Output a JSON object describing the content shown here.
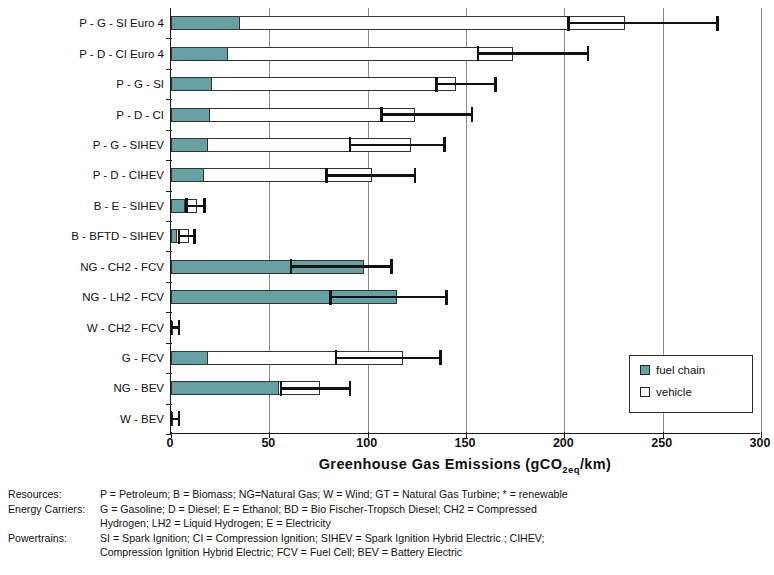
{
  "chart_data": {
    "type": "bar",
    "orientation": "horizontal",
    "stacked": true,
    "title": "",
    "xlabel": "Greenhouse Gas Emissions (gCO2eq/km)",
    "xlabel_main": "Greenhouse Gas Emissions (gCO",
    "xlabel_sub": "2eq",
    "xlabel_tail": "/km)",
    "ylabel": "",
    "xlim": [
      0,
      300
    ],
    "xticks": [
      0,
      50,
      100,
      150,
      200,
      250,
      300
    ],
    "xticklabels": [
      "0",
      "50",
      "100",
      "150",
      "200",
      "250",
      "300"
    ],
    "grid": "vertical",
    "legend_position": "lower-right",
    "legend": [
      "fuel chain",
      "vehicle"
    ],
    "categories": [
      "P - G - SI Euro 4",
      "P - D - CI Euro 4",
      "P - G - SI",
      "P - D - CI",
      "P - G - SIHEV",
      "P - D - CIHEV",
      "B - E - SIHEV",
      "B - BFTD - SIHEV",
      "NG - CH2 - FCV",
      "NG - LH2 - FCV",
      "W - CH2 - FCV",
      "G - FCV",
      "NG - BEV",
      "W - BEV"
    ],
    "series": [
      {
        "name": "fuel chain",
        "color": "#66a0a3",
        "values": [
          35,
          29,
          21,
          20,
          19,
          17,
          7,
          3,
          98,
          115,
          1,
          19,
          55,
          1
        ]
      },
      {
        "name": "vehicle",
        "color": "#ffffff",
        "values": [
          196,
          145,
          124,
          104,
          103,
          85,
          6,
          6,
          0,
          0,
          0,
          99,
          21,
          0
        ]
      }
    ],
    "totals": [
      231,
      174,
      145,
      124,
      122,
      102,
      13,
      9,
      98,
      115,
      1,
      118,
      76,
      1
    ],
    "error_bars": [
      {
        "category": "P - G - SI Euro 4",
        "low": 202,
        "high": 278
      },
      {
        "category": "P - D - CI Euro 4",
        "low": 156,
        "high": 212
      },
      {
        "category": "P - G - SI",
        "low": 135,
        "high": 165
      },
      {
        "category": "P - D - CI",
        "low": 107,
        "high": 153
      },
      {
        "category": "P - G - SIHEV",
        "low": 91,
        "high": 139
      },
      {
        "category": "P - D - CIHEV",
        "low": 79,
        "high": 124
      },
      {
        "category": "B - E - SIHEV",
        "low": 8,
        "high": 17
      },
      {
        "category": "B - BFTD - SIHEV",
        "low": 4,
        "high": 12
      },
      {
        "category": "NG - CH2 - FCV",
        "low": 61,
        "high": 112
      },
      {
        "category": "NG - LH2 - FCV",
        "low": 81,
        "high": 140
      },
      {
        "category": "W - CH2 - FCV",
        "low": 0,
        "high": 4
      },
      {
        "category": "G - FCV",
        "low": 84,
        "high": 137
      },
      {
        "category": "NG - BEV",
        "low": 56,
        "high": 91
      },
      {
        "category": "W - BEV",
        "low": 0,
        "high": 4
      }
    ]
  },
  "legend": {
    "fuel_chain": "fuel chain",
    "vehicle": "vehicle"
  },
  "notes": [
    {
      "key": "Resources:",
      "value": "P = Petroleum; B = Biomass; NG=Natural Gas; W = Wind; GT = Natural Gas Turbine; * = renewable",
      "continuation": ""
    },
    {
      "key": "Energy Carriers:",
      "value": "G = Gasoline; D = Diesel; E = Ethanol; BD = Bio Fischer-Tropsch Diesel; CH2 = Compressed",
      "continuation": "Hydrogen; LH2 = Liquid Hydrogen; E = Electricity"
    },
    {
      "key": "Powertrains:",
      "value": "SI = Spark Ignition; CI = Compression Ignition; SIHEV = Spark Ignition Hybrid Electric ; CIHEV;",
      "continuation": "Compression Ignition Hybrid Electric; FCV = Fuel Cell; BEV = Battery Electric"
    }
  ]
}
